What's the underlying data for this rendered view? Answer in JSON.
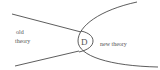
{
  "diagram": {
    "labels": {
      "old_theory_line1": "old",
      "old_theory_line2": "theory",
      "new_theory": "new theory",
      "region": "D"
    },
    "colors": {
      "stroke": "#333333",
      "text": "#555555",
      "background": "#ffffff"
    }
  }
}
